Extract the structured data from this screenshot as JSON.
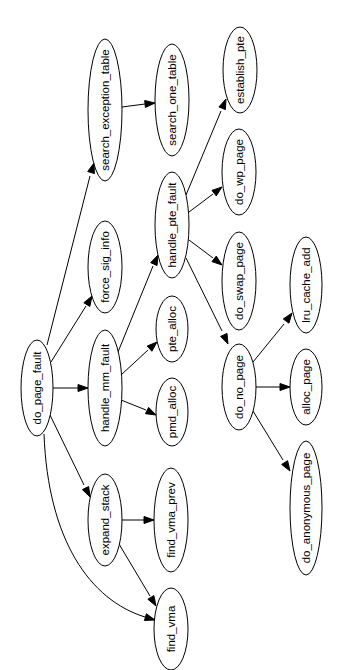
{
  "diagram": {
    "type": "call-graph",
    "orientation": "rotated-90",
    "colors": {
      "background": "#ffffff",
      "stroke": "#000000",
      "text": "#000000"
    },
    "nodes": [
      {
        "id": "do_page_fault",
        "label": "do_page_fault",
        "cx": 37,
        "cy": 388,
        "rx": 16,
        "ry": 48
      },
      {
        "id": "search_exception_table",
        "label": "search_exception_table",
        "cx": 105,
        "cy": 110,
        "rx": 17,
        "ry": 71
      },
      {
        "id": "force_sig_info",
        "label": "force_sig_info",
        "cx": 105,
        "cy": 267,
        "rx": 17,
        "ry": 46
      },
      {
        "id": "handle_mm_fault",
        "label": "handle_mm_fault",
        "cx": 105,
        "cy": 388,
        "rx": 17,
        "ry": 58
      },
      {
        "id": "expand_stack",
        "label": "expand_stack",
        "cx": 105,
        "cy": 520,
        "rx": 17,
        "ry": 46
      },
      {
        "id": "search_one_table",
        "label": "search_one_table",
        "cx": 172,
        "cy": 100,
        "rx": 17,
        "ry": 56
      },
      {
        "id": "handle_pte_fault",
        "label": "handle_pte_fault",
        "cx": 172,
        "cy": 225,
        "rx": 17,
        "ry": 53
      },
      {
        "id": "pte_alloc",
        "label": "pte_alloc",
        "cx": 172,
        "cy": 329,
        "rx": 16,
        "ry": 33
      },
      {
        "id": "pmd_alloc",
        "label": "pmd_alloc",
        "cx": 172,
        "cy": 412,
        "rx": 16,
        "ry": 34
      },
      {
        "id": "find_vma_prev",
        "label": "find_vma_prev",
        "cx": 171,
        "cy": 520,
        "rx": 17,
        "ry": 52
      },
      {
        "id": "find_vma",
        "label": "find_vma",
        "cx": 171,
        "cy": 629,
        "rx": 17,
        "ry": 41
      },
      {
        "id": "establish_pte",
        "label": "establish_pte",
        "cx": 240,
        "cy": 70,
        "rx": 17,
        "ry": 43
      },
      {
        "id": "do_wp_page",
        "label": "do_wp_page",
        "cx": 239,
        "cy": 172,
        "rx": 17,
        "ry": 43
      },
      {
        "id": "do_swap_page",
        "label": "do_swap_page",
        "cx": 239,
        "cy": 281,
        "rx": 17,
        "ry": 49
      },
      {
        "id": "do_no_page",
        "label": "do_no_page",
        "cx": 239,
        "cy": 387,
        "rx": 17,
        "ry": 43
      },
      {
        "id": "lru_cache_add",
        "label": "lru_cache_add",
        "cx": 306,
        "cy": 285,
        "rx": 16,
        "ry": 48
      },
      {
        "id": "alloc_page",
        "label": "alloc_page",
        "cx": 306,
        "cy": 387,
        "rx": 16,
        "ry": 38
      },
      {
        "id": "do_anonymous_page",
        "label": "do_anonymous_page",
        "cx": 306,
        "cy": 508,
        "rx": 16,
        "ry": 67
      }
    ],
    "edges": [
      {
        "from": "do_page_fault",
        "to": "search_exception_table",
        "d": "M47,345 L90,176",
        "arrow": [
          94,
          163
        ]
      },
      {
        "from": "do_page_fault",
        "to": "force_sig_info",
        "d": "M51,362 L86,306",
        "arrow": [
          92,
          296
        ]
      },
      {
        "from": "do_page_fault",
        "to": "handle_mm_fault",
        "d": "M53,388 L78,388",
        "arrow": [
          88,
          388
        ]
      },
      {
        "from": "do_page_fault",
        "to": "expand_stack",
        "d": "M50,415 L84,485",
        "arrow": [
          90,
          497
        ]
      },
      {
        "from": "do_page_fault",
        "to": "find_vma",
        "d": "M44,434 C48,540 90,600 145,617",
        "arrow": [
          155,
          620
        ]
      },
      {
        "from": "search_exception_table",
        "to": "search_one_table",
        "d": "M122,107 L145,104",
        "arrow": [
          155,
          103
        ]
      },
      {
        "from": "handle_mm_fault",
        "to": "handle_pte_fault",
        "d": "M118,352 L153,266",
        "arrow": [
          158,
          255
        ]
      },
      {
        "from": "handle_mm_fault",
        "to": "pte_alloc",
        "d": "M121,375 L148,350",
        "arrow": [
          157,
          342
        ]
      },
      {
        "from": "handle_mm_fault",
        "to": "pmd_alloc",
        "d": "M121,400 L146,410",
        "arrow": [
          156,
          415
        ]
      },
      {
        "from": "handle_pte_fault",
        "to": "establish_pte",
        "d": "M186,195 L221,111",
        "arrow": [
          226,
          99
        ]
      },
      {
        "from": "handle_pte_fault",
        "to": "do_wp_page",
        "d": "M189,212 L213,194",
        "arrow": [
          222,
          187
        ]
      },
      {
        "from": "handle_pte_fault",
        "to": "do_swap_page",
        "d": "M189,240 L213,258",
        "arrow": [
          222,
          265
        ]
      },
      {
        "from": "handle_pte_fault",
        "to": "do_no_page",
        "d": "M186,258 L222,331",
        "arrow": [
          228,
          344
        ]
      },
      {
        "from": "do_no_page",
        "to": "lru_cache_add",
        "d": "M253,362 L284,324",
        "arrow": [
          292,
          313
        ]
      },
      {
        "from": "do_no_page",
        "to": "alloc_page",
        "d": "M256,387 L280,387",
        "arrow": [
          290,
          387
        ]
      },
      {
        "from": "do_no_page",
        "to": "do_anonymous_page",
        "d": "M253,411 L283,460",
        "arrow": [
          290,
          471
        ]
      },
      {
        "from": "expand_stack",
        "to": "find_vma_prev",
        "d": "M122,520 L144,520",
        "arrow": [
          154,
          520
        ]
      },
      {
        "from": "expand_stack",
        "to": "find_vma",
        "d": "M119,544 L150,596",
        "arrow": [
          156,
          606
        ]
      }
    ]
  }
}
